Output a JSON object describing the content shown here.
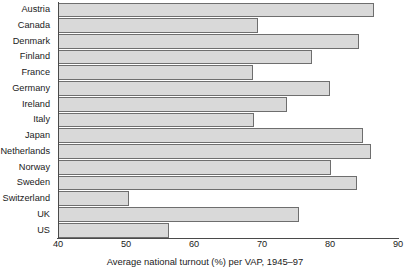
{
  "chart_data": {
    "type": "bar",
    "orientation": "horizontal",
    "title": "",
    "xlabel": "Average national turnout (%) per VAP, 1945–97",
    "ylabel": "",
    "xlim": [
      40,
      90
    ],
    "xticks": [
      40,
      50,
      60,
      70,
      80,
      90
    ],
    "xticklabels": [
      "40",
      "50",
      "60",
      "70",
      "80",
      "90"
    ],
    "grid": false,
    "legend": null,
    "bar_fill_color": "#d9d9d9",
    "bar_edge_color": "#6e6e6e",
    "axis_color": "#4a4a4a",
    "categories": [
      "Austria",
      "Canada",
      "Denmark",
      "Finland",
      "France",
      "Germany",
      "Ireland",
      "Italy",
      "Japan",
      "Netherlands",
      "Norway",
      "Sweden",
      "Switzerland",
      "UK",
      "US"
    ],
    "values": [
      86.3,
      69.3,
      84.1,
      77.2,
      68.5,
      79.9,
      73.5,
      68.7,
      84.7,
      85.9,
      80.0,
      83.8,
      50.3,
      75.3,
      56.2
    ]
  }
}
